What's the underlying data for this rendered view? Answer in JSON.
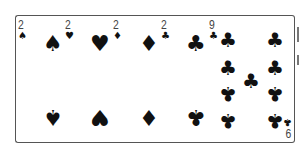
{
  "hand": {
    "cards": [
      {
        "rank": "2",
        "suit": "spades",
        "suit_symbol": "♠",
        "color": "#111111"
      },
      {
        "rank": "2",
        "suit": "hearts",
        "suit_symbol": "♥",
        "color": "#111111"
      },
      {
        "rank": "2",
        "suit": "diamonds",
        "suit_symbol": "♦",
        "color": "#111111"
      },
      {
        "rank": "2",
        "suit": "clubs",
        "suit_symbol": "♣",
        "color": "#111111"
      },
      {
        "rank": "9",
        "suit": "clubs",
        "suit_symbol": "♣",
        "color": "#111111",
        "rank_bottom_rotated": "6"
      }
    ]
  },
  "colors": {
    "card_border": "#555555",
    "card_face": "#ffffff",
    "ink": "#111111",
    "index_text": "#444444"
  }
}
